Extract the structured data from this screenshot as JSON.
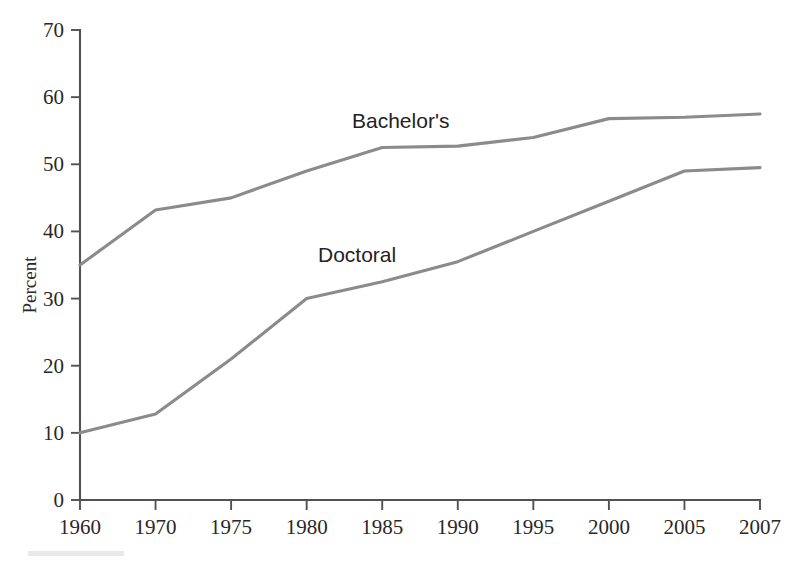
{
  "chart_data": {
    "type": "line",
    "title": "",
    "xlabel": "",
    "ylabel": "Percent",
    "categories": [
      "1960",
      "1970",
      "1975",
      "1980",
      "1985",
      "1990",
      "1995",
      "2000",
      "2005",
      "2007"
    ],
    "ylim": [
      0,
      70
    ],
    "yticks": [
      0,
      10,
      20,
      30,
      40,
      50,
      60,
      70
    ],
    "ytick_labels": [
      "0",
      "10",
      "20",
      "30",
      "40",
      "50",
      "60",
      "70"
    ],
    "grid": false,
    "legend_position": "inline-annotation",
    "series": [
      {
        "name": "Bachelor's",
        "color": "#8c8a8b",
        "values": [
          35,
          43.2,
          45,
          49,
          52.5,
          52.7,
          54,
          56.8,
          57,
          57.5
        ]
      },
      {
        "name": "Doctoral",
        "color": "#8c8a8b",
        "values": [
          10,
          12.8,
          21,
          30,
          32.5,
          35.5,
          40,
          44.5,
          49,
          49.5
        ]
      }
    ],
    "annotations": [
      {
        "text": "Bachelor's",
        "series": "Bachelor's",
        "x_px": 352,
        "y_px": 128
      },
      {
        "text": "Doctoral",
        "series": "Doctoral",
        "x_px": 318,
        "y_px": 262
      }
    ]
  },
  "axis": {
    "y_title": "Percent",
    "x_tick_labels": [
      "1960",
      "1970",
      "1975",
      "1980",
      "1985",
      "1990",
      "1995",
      "2000",
      "2005",
      "2007"
    ],
    "y_tick_labels": [
      "0",
      "10",
      "20",
      "30",
      "40",
      "50",
      "60",
      "70"
    ]
  },
  "colors": {
    "line": "#8c8a8b",
    "axis": "#555052",
    "text": "#2b2728",
    "background": "#ffffff"
  }
}
